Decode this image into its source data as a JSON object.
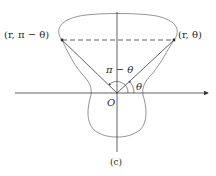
{
  "figure": {
    "caption": "(c)",
    "origin_label": "O",
    "point_left_label": "(r, π − θ)",
    "point_right_label": "(r, θ)",
    "angle_left_label": "π − θ",
    "angle_right_label": "θ"
  },
  "colors": {
    "curve": "#7a7a7a",
    "axis": "#3a3a3a",
    "ray": "#3a3a3a",
    "text": "#2a2a2a"
  }
}
